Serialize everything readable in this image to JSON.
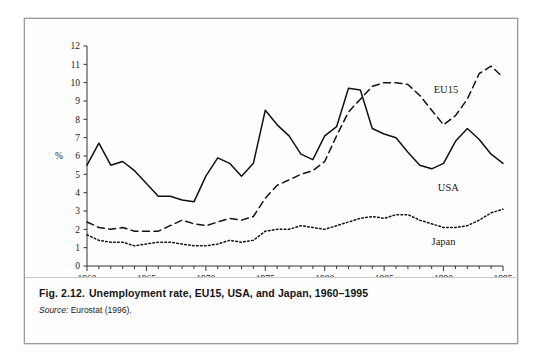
{
  "figure": {
    "caption_number": "Fig. 2.12.",
    "caption_text": "Unemployment rate, EU15, USA, and Japan, 1960–1995",
    "source_label": "Source:",
    "source_text": " Eurostat (1996)."
  },
  "chart_data": {
    "type": "line",
    "title": "Unemployment rate, EU15, USA, and Japan, 1960–1995",
    "xlabel": "",
    "ylabel": "%",
    "xlim": [
      1960,
      1995
    ],
    "ylim": [
      0,
      12
    ],
    "ytick_labels": [
      "0",
      "1",
      "2",
      "3",
      "4",
      "5",
      "6",
      "7",
      "8",
      "9",
      "10",
      "11",
      "12"
    ],
    "yticks": [
      0,
      1,
      2,
      3,
      4,
      5,
      6,
      7,
      8,
      9,
      10,
      11,
      12
    ],
    "xtick_labels": [
      "1960",
      "1965",
      "1970",
      "1975",
      "1980",
      "1985",
      "1990",
      "1995"
    ],
    "xticks": [
      1960,
      1965,
      1970,
      1975,
      1980,
      1985,
      1990,
      1995
    ],
    "minor_xtick_interval": 1,
    "grid": false,
    "legend": "inline-labels",
    "x": [
      1960,
      1961,
      1962,
      1963,
      1964,
      1965,
      1966,
      1967,
      1968,
      1969,
      1970,
      1971,
      1972,
      1973,
      1974,
      1975,
      1976,
      1977,
      1978,
      1979,
      1980,
      1981,
      1982,
      1983,
      1984,
      1985,
      1986,
      1987,
      1988,
      1989,
      1990,
      1991,
      1992,
      1993,
      1994,
      1995
    ],
    "series": [
      {
        "name": "USA",
        "style": "solid",
        "label_position": {
          "x": 1990.4,
          "y": 4.3
        },
        "values": [
          5.5,
          6.7,
          5.5,
          5.7,
          5.2,
          4.5,
          3.8,
          3.8,
          3.6,
          3.5,
          4.9,
          5.9,
          5.6,
          4.9,
          5.6,
          8.5,
          7.7,
          7.1,
          6.1,
          5.8,
          7.1,
          7.6,
          9.7,
          9.6,
          7.5,
          7.2,
          7.0,
          6.2,
          5.5,
          5.3,
          5.6,
          6.8,
          7.5,
          6.9,
          6.1,
          5.6
        ]
      },
      {
        "name": "EU15",
        "style": "dashed",
        "label_position": {
          "x": 1990.2,
          "y": 9.6
        },
        "values": [
          2.4,
          2.1,
          2.0,
          2.1,
          1.9,
          1.9,
          1.9,
          2.2,
          2.5,
          2.3,
          2.2,
          2.4,
          2.6,
          2.5,
          2.7,
          3.7,
          4.4,
          4.7,
          5.0,
          5.2,
          5.7,
          7.1,
          8.4,
          9.1,
          9.8,
          10.0,
          10.0,
          9.9,
          9.3,
          8.5,
          7.7,
          8.2,
          9.1,
          10.5,
          10.9,
          10.3
        ]
      },
      {
        "name": "Japan",
        "style": "dotted",
        "label_position": {
          "x": 1990.0,
          "y": 1.35
        },
        "values": [
          1.7,
          1.4,
          1.3,
          1.3,
          1.1,
          1.2,
          1.3,
          1.3,
          1.2,
          1.1,
          1.1,
          1.2,
          1.4,
          1.3,
          1.4,
          1.9,
          2.0,
          2.0,
          2.2,
          2.1,
          2.0,
          2.2,
          2.4,
          2.6,
          2.7,
          2.6,
          2.8,
          2.8,
          2.5,
          2.3,
          2.1,
          2.1,
          2.2,
          2.5,
          2.9,
          3.1
        ]
      }
    ]
  },
  "colors": {
    "line": "#111111",
    "axis": "#333333",
    "frame_border": "#9a9a9a",
    "background": "#fefefe"
  }
}
